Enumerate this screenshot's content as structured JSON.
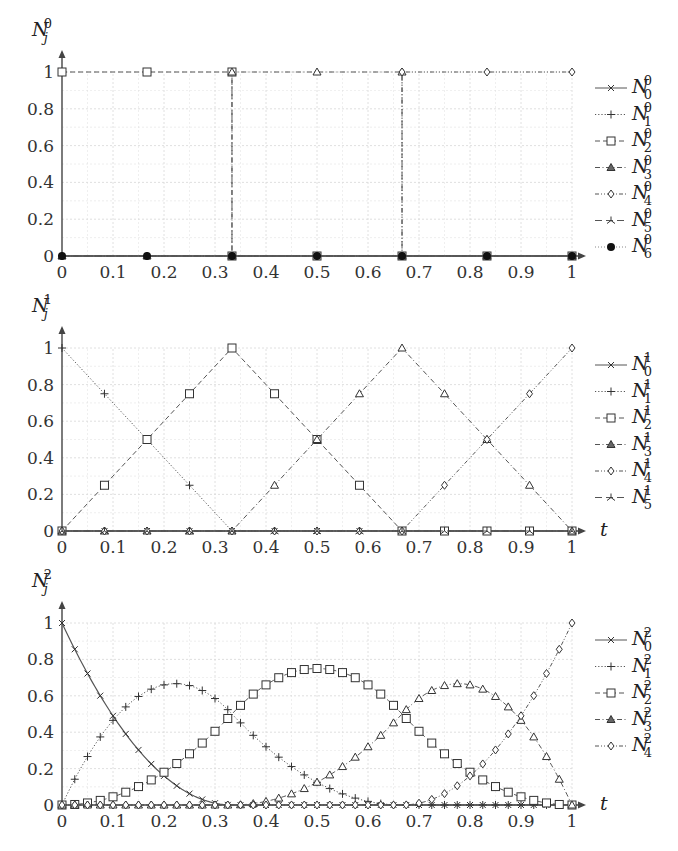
{
  "chart_data": [
    {
      "type": "line",
      "title": "",
      "ylabel": "N_j^0",
      "ylabel_main": "N",
      "ylabel_sub": "j",
      "ylabel_sup": "0",
      "xlabel": "",
      "xlim": [
        0,
        1
      ],
      "ylim": [
        0,
        1
      ],
      "xticks": [
        "0",
        "0.1",
        "0.2",
        "0.3",
        "0.4",
        "0.5",
        "0.6",
        "0.7",
        "0.8",
        "0.9",
        "1"
      ],
      "yticks": [
        "0",
        "0.2",
        "0.4",
        "0.6",
        "0.8",
        "1"
      ],
      "grid": true,
      "legend_position": "right",
      "series": [
        {
          "name": "N_0^0",
          "sub": "0",
          "sup": "0",
          "marker": "x",
          "dash": "solid",
          "x": [
            0,
            1
          ],
          "values": [
            0,
            0
          ]
        },
        {
          "name": "N_1^0",
          "sub": "1",
          "sup": "0",
          "marker": "plus",
          "dash": "dotted",
          "x": [
            0,
            1
          ],
          "values": [
            0,
            0
          ]
        },
        {
          "name": "N_2^0",
          "sub": "2",
          "sup": "0",
          "marker": "square",
          "dash": "dashed",
          "x": [
            0,
            0.1667,
            0.3333,
            0.3333,
            0.5,
            0.6667,
            0.8333,
            1
          ],
          "values": [
            1,
            1,
            1,
            0,
            0,
            0,
            0,
            0
          ]
        },
        {
          "name": "N_3^0",
          "sub": "3",
          "sup": "0",
          "marker": "triangle",
          "dash": "dashdot",
          "x": [
            0,
            0.1667,
            0.3333,
            0.3333,
            0.5,
            0.6667,
            0.6667,
            0.8333,
            1
          ],
          "values": [
            0,
            0,
            0,
            1,
            1,
            1,
            0,
            0,
            0
          ]
        },
        {
          "name": "N_4^0",
          "sub": "4",
          "sup": "0",
          "marker": "diamond",
          "dash": "dashdotdot",
          "x": [
            0,
            0.1667,
            0.3333,
            0.5,
            0.6667,
            0.6667,
            0.8333,
            1
          ],
          "values": [
            0,
            0,
            0,
            0,
            0,
            1,
            1,
            1
          ]
        },
        {
          "name": "N_5^0",
          "sub": "5",
          "sup": "0",
          "marker": "tri",
          "dash": "longdash",
          "x": [
            0,
            1
          ],
          "values": [
            0,
            0
          ]
        },
        {
          "name": "N_6^0",
          "sub": "6",
          "sup": "0",
          "marker": "dot",
          "dash": "none",
          "x": [
            0,
            0.1667,
            0.3333,
            0.5,
            0.6667,
            0.8333,
            1
          ],
          "values": [
            0,
            0,
            0,
            0,
            0,
            0,
            0
          ]
        }
      ]
    },
    {
      "type": "line",
      "title": "",
      "ylabel": "N_j^1",
      "ylabel_main": "N",
      "ylabel_sub": "j",
      "ylabel_sup": "1",
      "xlabel": "t",
      "xlim": [
        0,
        1
      ],
      "ylim": [
        0,
        1
      ],
      "xticks": [
        "0",
        "0.1",
        "0.2",
        "0.3",
        "0.4",
        "0.5",
        "0.6",
        "0.7",
        "0.8",
        "0.9",
        "1"
      ],
      "yticks": [
        "0",
        "0.2",
        "0.4",
        "0.6",
        "0.8",
        "1"
      ],
      "grid": true,
      "legend_position": "right",
      "series": [
        {
          "name": "N_0^1",
          "sub": "0",
          "sup": "1",
          "marker": "x",
          "dash": "solid",
          "x": [
            0,
            0.0833,
            0.1667,
            0.25,
            0.3333,
            0.4167,
            0.5,
            0.5833,
            0.6667,
            0.75,
            0.8333,
            0.9167,
            1
          ],
          "values": [
            0,
            0,
            0,
            0,
            0,
            0,
            0,
            0,
            0,
            0,
            0,
            0,
            0
          ]
        },
        {
          "name": "N_1^1",
          "sub": "1",
          "sup": "1",
          "marker": "plus",
          "dash": "dotted",
          "x": [
            0,
            0.0833,
            0.1667,
            0.25,
            0.3333,
            0.4167,
            0.5,
            0.5833,
            0.6667,
            0.75,
            0.8333,
            0.9167,
            1
          ],
          "values": [
            1,
            0.75,
            0.5,
            0.25,
            0,
            0,
            0,
            0,
            0,
            0,
            0,
            0,
            0
          ]
        },
        {
          "name": "N_2^1",
          "sub": "2",
          "sup": "1",
          "marker": "square",
          "dash": "dashed",
          "x": [
            0,
            0.0833,
            0.1667,
            0.25,
            0.3333,
            0.4167,
            0.5,
            0.5833,
            0.6667,
            0.75,
            0.8333,
            0.9167,
            1
          ],
          "values": [
            0,
            0.25,
            0.5,
            0.75,
            1,
            0.75,
            0.5,
            0.25,
            0,
            0,
            0,
            0,
            0
          ]
        },
        {
          "name": "N_3^1",
          "sub": "3",
          "sup": "1",
          "marker": "triangle",
          "dash": "dashdot",
          "x": [
            0,
            0.0833,
            0.1667,
            0.25,
            0.3333,
            0.4167,
            0.5,
            0.5833,
            0.6667,
            0.75,
            0.8333,
            0.9167,
            1
          ],
          "values": [
            0,
            0,
            0,
            0,
            0,
            0.25,
            0.5,
            0.75,
            1,
            0.75,
            0.5,
            0.25,
            0
          ]
        },
        {
          "name": "N_4^1",
          "sub": "4",
          "sup": "1",
          "marker": "diamond",
          "dash": "dashdotdot",
          "x": [
            0,
            0.0833,
            0.1667,
            0.25,
            0.3333,
            0.4167,
            0.5,
            0.5833,
            0.6667,
            0.75,
            0.8333,
            0.9167,
            1
          ],
          "values": [
            0,
            0,
            0,
            0,
            0,
            0,
            0,
            0,
            0,
            0.25,
            0.5,
            0.75,
            1
          ]
        },
        {
          "name": "N_5^1",
          "sub": "5",
          "sup": "1",
          "marker": "tri",
          "dash": "longdash",
          "x": [
            0,
            0.0833,
            0.1667,
            0.25,
            0.3333,
            0.4167,
            0.5,
            0.5833,
            0.6667,
            0.75,
            0.8333,
            0.9167,
            1
          ],
          "values": [
            0,
            0,
            0,
            0,
            0,
            0,
            0,
            0,
            0,
            0,
            0,
            0,
            0
          ]
        }
      ]
    },
    {
      "type": "line",
      "title": "",
      "ylabel": "N_j^2",
      "ylabel_main": "N",
      "ylabel_sub": "j",
      "ylabel_sup": "2",
      "xlabel": "t",
      "xlim": [
        0,
        1
      ],
      "ylim": [
        0,
        1
      ],
      "xticks": [
        "0",
        "0.1",
        "0.2",
        "0.3",
        "0.4",
        "0.5",
        "0.6",
        "0.7",
        "0.8",
        "0.9",
        "1"
      ],
      "yticks": [
        "0",
        "0.2",
        "0.4",
        "0.6",
        "0.8",
        "1"
      ],
      "grid": true,
      "legend_position": "right",
      "knots": [
        0,
        0,
        0.3333,
        0.6667,
        1,
        1
      ],
      "samples": 41,
      "series": [
        {
          "name": "N_0^2",
          "sub": "0",
          "sup": "2",
          "marker": "x",
          "dash": "solid",
          "formula": "(1-3t)^2 on [0,1/3]",
          "peak": {
            "x": 0,
            "y": 1
          }
        },
        {
          "name": "N_1^2",
          "sub": "1",
          "sup": "2",
          "marker": "plus",
          "dash": "dotted",
          "formula": "quadratic B-spline",
          "peak": {
            "x": 0.22,
            "y": 0.667
          }
        },
        {
          "name": "N_2^2",
          "sub": "2",
          "sup": "2",
          "marker": "square",
          "dash": "dashed",
          "formula": "quadratic B-spline",
          "peak": {
            "x": 0.5,
            "y": 0.75
          }
        },
        {
          "name": "N_3^2",
          "sub": "3",
          "sup": "2",
          "marker": "triangle",
          "dash": "dashdot",
          "formula": "quadratic B-spline",
          "peak": {
            "x": 0.78,
            "y": 0.667
          }
        },
        {
          "name": "N_4^2",
          "sub": "4",
          "sup": "2",
          "marker": "diamond",
          "dash": "dashdotdot",
          "formula": "(3t-2)^2 on [2/3,1]",
          "peak": {
            "x": 1,
            "y": 1
          }
        }
      ]
    }
  ]
}
